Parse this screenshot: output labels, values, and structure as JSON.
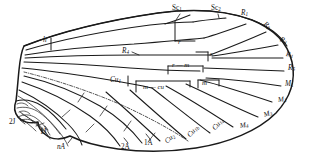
{
  "figure": {
    "kind": "insect-wing-venation-diagram",
    "title": "",
    "colors": {
      "ink": "#1a1a1a",
      "background": "#ffffff",
      "secondary_ink": "#2b2b2b"
    }
  },
  "labels": {
    "costal_margin": [
      {
        "id": "h",
        "text": "h",
        "base": "h",
        "sub": "",
        "style": "italic",
        "x": 43,
        "y": 37,
        "note": "humeral crossvein"
      },
      {
        "id": "sc1",
        "text": "Sc1",
        "base": "Sc",
        "sub": "1",
        "style": "roman",
        "x": 172,
        "y": 7,
        "note": "subcosta anterior"
      },
      {
        "id": "sc2",
        "text": "Sc2",
        "base": "Sc",
        "sub": "2",
        "style": "roman",
        "x": 211,
        "y": 7,
        "note": "subcosta posterior"
      }
    ],
    "radial": [
      {
        "id": "r1",
        "text": "R1",
        "base": "R",
        "sub": "1",
        "x": 241,
        "y": 12,
        "rot": 0,
        "style": "italic"
      },
      {
        "id": "r2",
        "text": "R2",
        "base": "R",
        "sub": "2",
        "x": 264,
        "y": 22,
        "rot": 38,
        "style": "italic"
      },
      {
        "id": "r3",
        "text": "R3",
        "base": "R",
        "sub": "3",
        "x": 280,
        "y": 38,
        "rot": 22,
        "style": "italic"
      },
      {
        "id": "r4",
        "text": "R4",
        "base": "R",
        "sub": "4",
        "x": 286,
        "y": 53,
        "rot": 8,
        "style": "italic"
      },
      {
        "id": "r5",
        "text": "R5",
        "base": "R",
        "sub": "5",
        "x": 288,
        "y": 67,
        "rot": 0,
        "style": "italic"
      },
      {
        "id": "rs",
        "text": "R4",
        "base": "R",
        "sub": "4",
        "x": 122,
        "y": 50,
        "rot": 0,
        "style": "italic"
      }
    ],
    "medial": [
      {
        "id": "m1",
        "text": "M1",
        "base": "M",
        "sub": "1",
        "x": 285,
        "y": 83,
        "rot": 0,
        "style": "italic"
      },
      {
        "id": "m2",
        "text": "M2",
        "base": "M",
        "sub": "2",
        "x": 278,
        "y": 99,
        "rot": -8,
        "style": "italic"
      },
      {
        "id": "m3",
        "text": "M3",
        "base": "M",
        "sub": "3",
        "x": 264,
        "y": 114,
        "rot": -18,
        "style": "italic"
      },
      {
        "id": "m4",
        "text": "M4",
        "base": "M",
        "sub": "4",
        "x": 240,
        "y": 125,
        "rot": -10,
        "style": "italic"
      }
    ],
    "cubital": [
      {
        "id": "cu1",
        "text": "Cu1",
        "base": "Cu",
        "sub": "1",
        "x": 117,
        "y": 79,
        "rot": 0,
        "style": "italic"
      },
      {
        "id": "cu1a",
        "text": "Cu1a",
        "base": "Cu",
        "sub": "1a",
        "x": 214,
        "y": 128,
        "rot": -48,
        "style": "italic"
      },
      {
        "id": "cu1b",
        "text": "Cu1b",
        "base": "Cu",
        "sub": "1b",
        "x": 189,
        "y": 135,
        "rot": -48,
        "style": "italic"
      },
      {
        "id": "cu2",
        "text": "Cu2",
        "base": "Cu",
        "sub": "2",
        "x": 166,
        "y": 141,
        "rot": -40,
        "style": "italic"
      }
    ],
    "anal": [
      {
        "id": "1a",
        "text": "1A",
        "base": "1A",
        "sub": "",
        "x": 144,
        "y": 142,
        "rot": 0,
        "style": "roman"
      },
      {
        "id": "2a",
        "text": "2A",
        "base": "2A",
        "sub": "",
        "x": 121,
        "y": 146,
        "rot": 0,
        "style": "roman"
      },
      {
        "id": "na",
        "text": "nA",
        "base": "nA",
        "sub": "",
        "x": 57,
        "y": 146,
        "rot": 0,
        "style": "italic-n"
      }
    ],
    "jugal": [
      {
        "id": "1j",
        "text": "1J",
        "base": "1J",
        "sub": "",
        "x": 40,
        "y": 131,
        "rot": 0,
        "style": "roman"
      },
      {
        "id": "2j",
        "text": "2J",
        "base": "2J",
        "sub": "",
        "x": 9,
        "y": 121,
        "rot": 0,
        "style": "roman"
      }
    ],
    "crossveins": [
      {
        "id": "r-cv",
        "text": "r",
        "x": 168,
        "y": 43,
        "style": "italic",
        "note": "radial crossvein"
      },
      {
        "id": "s-cv",
        "text": "s",
        "x": 203,
        "y": 55,
        "style": "italic",
        "note": "sectoral crossvein"
      },
      {
        "id": "r-m",
        "text": "r — m",
        "x": 172,
        "y": 70,
        "style": "italic",
        "note": "radio-medial crossvein"
      },
      {
        "id": "m-cv",
        "text": "m",
        "x": 204,
        "y": 85,
        "style": "italic",
        "note": "medial crossvein"
      },
      {
        "id": "m-cu",
        "text": "m — cu",
        "x": 146,
        "y": 86,
        "style": "italic",
        "note": "medio-cubital crossvein"
      }
    ]
  }
}
